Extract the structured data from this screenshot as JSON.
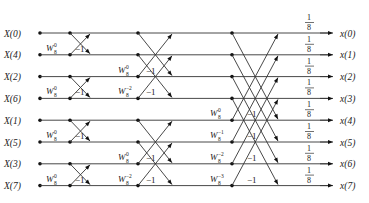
{
  "diagram": {
    "type": "radix-2 DIT IFFT butterfly flow graph (N=8)",
    "inputs": [
      "X(0)",
      "X(4)",
      "X(2)",
      "X(6)",
      "X(1)",
      "X(5)",
      "X(3)",
      "X(7)"
    ],
    "outputs": [
      "x(0)",
      "x(1)",
      "x(2)",
      "x(3)",
      "x(4)",
      "x(5)",
      "x(6)",
      "x(7)"
    ],
    "scale_factor": {
      "numerator": "1",
      "denominator": "8"
    },
    "stage1": {
      "twiddle": {
        "base": "W",
        "sub": "8",
        "sup": "0"
      },
      "minus_one": "−1"
    },
    "stage2": {
      "twiddles": [
        {
          "base": "W",
          "sub": "8",
          "sup": "0"
        },
        {
          "base": "W",
          "sub": "8",
          "sup": "−2"
        }
      ],
      "minus_one": "−1"
    },
    "stage3": {
      "twiddles": [
        {
          "base": "W",
          "sub": "8",
          "sup": "0"
        },
        {
          "base": "W",
          "sub": "8",
          "sup": "−1"
        },
        {
          "base": "W",
          "sub": "8",
          "sup": "−2"
        },
        {
          "base": "W",
          "sub": "8",
          "sup": "−3"
        }
      ],
      "minus_one": "−1"
    },
    "colors": {
      "line": "#333333",
      "text": "#222222"
    }
  }
}
